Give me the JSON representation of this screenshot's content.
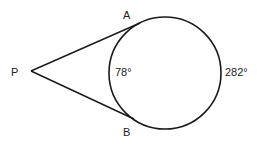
{
  "diagram": {
    "type": "circle-with-two-tangents",
    "point_labels": {
      "external_point": "P",
      "tangent_point_top": "A",
      "tangent_point_bottom": "B"
    },
    "arc_labels": {
      "minor_arc": "78°",
      "major_arc": "282°"
    },
    "colors": {
      "stroke": "#1a1a1a",
      "text": "#222222",
      "background": "#ffffff"
    }
  }
}
